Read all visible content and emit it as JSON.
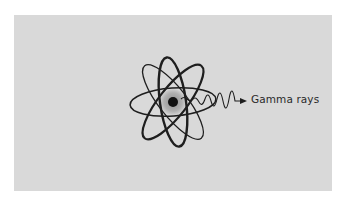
{
  "figure": {
    "background_color": "#ffffff",
    "panel_color": "#d9d9d9",
    "atom": {
      "icon": "atom-icon",
      "orbit_color": "#1e1e1e",
      "orbit_count": 3,
      "nucleus": {
        "icon": "nucleus-icon",
        "core_color": "#111111",
        "halo_color": "#a8a8a8"
      }
    },
    "emission": {
      "icon": "wavy-arrow-icon",
      "label": "Gamma rays"
    }
  }
}
